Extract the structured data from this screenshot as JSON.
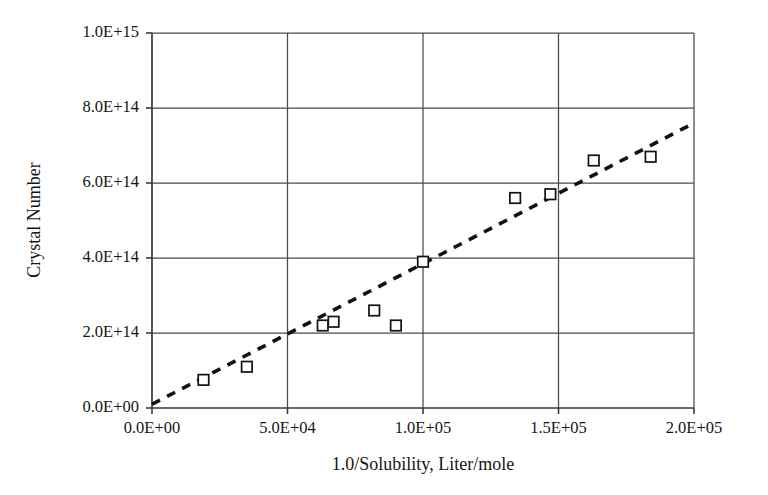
{
  "chart_data": {
    "type": "scatter",
    "title": "",
    "xlabel": "1.0/Solubility, Liter/mole",
    "ylabel": "Crystal Number",
    "xlim": [
      0,
      200000
    ],
    "ylim": [
      0,
      1000000000000000.0
    ],
    "grid": true,
    "legend": false,
    "x_tick_labels": [
      "0.0E+00",
      "5.0E+04",
      "1.0E+05",
      "1.5E+05",
      "2.0E+05"
    ],
    "x_tick_values": [
      0,
      50000,
      100000,
      150000,
      200000
    ],
    "y_tick_labels": [
      "0.0E+00",
      "2.0E+14",
      "4.0E+14",
      "6.0E+14",
      "8.0E+14",
      "1.0E+15"
    ],
    "y_tick_values": [
      0,
      200000000000000.0,
      400000000000000.0,
      600000000000000.0,
      800000000000000.0,
      1000000000000000.0
    ],
    "marker_style": "open-square",
    "points": [
      {
        "x": 19000,
        "y": 75000000000000.0
      },
      {
        "x": 35000,
        "y": 110000000000000.0
      },
      {
        "x": 63000,
        "y": 220000000000000.0
      },
      {
        "x": 67000,
        "y": 230000000000000.0
      },
      {
        "x": 82000,
        "y": 260000000000000.0
      },
      {
        "x": 90000,
        "y": 220000000000000.0
      },
      {
        "x": 100000,
        "y": 390000000000000.0
      },
      {
        "x": 134000,
        "y": 560000000000000.0
      },
      {
        "x": 147000,
        "y": 570000000000000.0
      },
      {
        "x": 163000,
        "y": 660000000000000.0
      },
      {
        "x": 184000,
        "y": 670000000000000.0
      }
    ],
    "trendline": {
      "style": "dashed",
      "x0": 0,
      "y0": 10000000000000.0,
      "x1": 200000,
      "y1": 760000000000000.0
    }
  }
}
